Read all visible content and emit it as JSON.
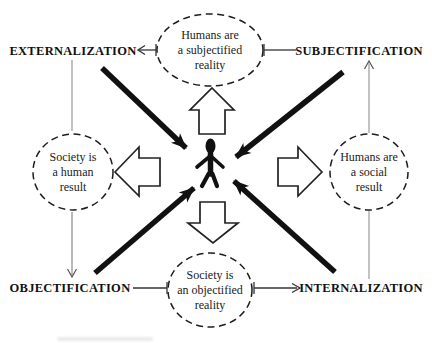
{
  "diagram": {
    "processes": {
      "externalization": "EXTERNALIZATION",
      "subjectification": "SUBJECTIFICATION",
      "objectification": "OBJECTIFICATION",
      "internalization": "INTERNALIZATION"
    },
    "statements": {
      "top": {
        "lines": [
          "Humans are",
          "a subjectified",
          "reality"
        ]
      },
      "left": {
        "lines": [
          "Society is",
          "a human",
          "result"
        ]
      },
      "right": {
        "lines": [
          "Humans are",
          "a social",
          "result"
        ]
      },
      "bottom": {
        "lines": [
          "Society is",
          "an objectified",
          "reality"
        ]
      }
    },
    "icons": {
      "center": "person-icon",
      "outward_arrows": [
        "block-arrow-up-icon",
        "block-arrow-right-icon",
        "block-arrow-down-icon",
        "block-arrow-left-icon"
      ],
      "inward_arrows": [
        "solid-arrow-from-top-left-icon",
        "solid-arrow-from-top-right-icon",
        "solid-arrow-from-bottom-left-icon",
        "solid-arrow-from-bottom-right-icon"
      ]
    },
    "colors": {
      "ink": "#111111",
      "thin_line": "#8f8f8f",
      "connector": "#333333",
      "background": "#ffffff"
    }
  }
}
